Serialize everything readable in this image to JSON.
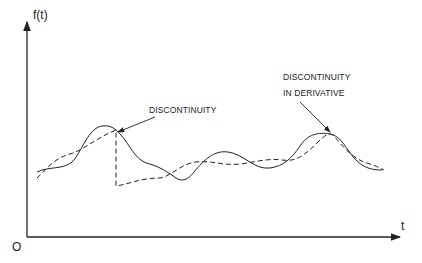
{
  "figure": {
    "y_axis_label": "f(t)",
    "x_axis_label": "t",
    "origin_label": "O",
    "annotations": {
      "discontinuity": "DISCONTINUITY",
      "derivative_line1": "DISCONTINUITY",
      "derivative_line2": "IN DERIVATIVE"
    },
    "curves": [
      {
        "name": "original-signal",
        "style": "solid"
      },
      {
        "name": "approximation",
        "style": "dashed"
      }
    ],
    "colors": {
      "ink": "#222222",
      "background": "#ffffff"
    }
  }
}
